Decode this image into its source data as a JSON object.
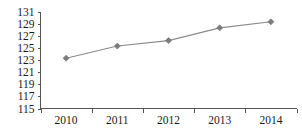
{
  "chart_data": {
    "type": "line",
    "title": "",
    "subtitle": "",
    "xlabel": "",
    "ylabel": "",
    "categories": [
      "2010",
      "2011",
      "2012",
      "2013",
      "2014"
    ],
    "values": [
      123.3,
      125.3,
      126.2,
      128.3,
      129.3
    ],
    "series": [
      {
        "name": "",
        "values": [
          123.3,
          125.3,
          126.2,
          128.3,
          129.3
        ]
      }
    ],
    "ylim": [
      115,
      131
    ],
    "xlim": [
      2010,
      2014
    ],
    "y_ticks": [
      115,
      117,
      119,
      121,
      123,
      125,
      127,
      129,
      131
    ],
    "x_ticks": [
      "2010",
      "2011",
      "2012",
      "2013",
      "2014"
    ],
    "grid": false,
    "legend": false,
    "legend_position": "none",
    "marker": "diamond",
    "line_color": "#8a8a8a",
    "marker_color": "#7d7d7d",
    "axis_color": "#555555",
    "text_color": "#1a1a1a",
    "background_color": "#ffffff"
  },
  "axes": {
    "y_tick_labels": [
      "131",
      "129",
      "127",
      "125",
      "123",
      "121",
      "119",
      "117",
      "115"
    ],
    "x_tick_labels": [
      "2010",
      "2011",
      "2012",
      "2013",
      "2014"
    ]
  }
}
